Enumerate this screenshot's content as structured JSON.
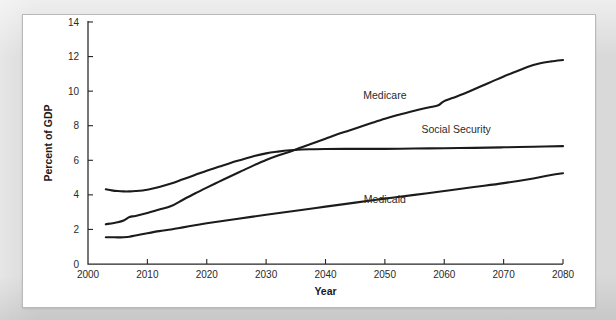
{
  "page": {
    "background_color": "#d7d7d7",
    "panel_color": "#ffffff",
    "panel_border_color": "#b9b9b9"
  },
  "chart_data": {
    "type": "line",
    "title": "",
    "xlabel": "Year",
    "ylabel": "Percent of GDP",
    "xlim": [
      2000,
      2080
    ],
    "ylim": [
      0,
      14
    ],
    "xticks": [
      2000,
      2010,
      2020,
      2030,
      2040,
      2050,
      2060,
      2070,
      2080
    ],
    "yticks": [
      0,
      2,
      4,
      6,
      8,
      10,
      12,
      14
    ],
    "xtick_labels": [
      "2000",
      "2010",
      "2020",
      "2030",
      "2040",
      "2050",
      "2060",
      "2070",
      "2080"
    ],
    "ytick_labels": [
      "0",
      "2",
      "4",
      "6",
      "8",
      "10",
      "12",
      "14"
    ],
    "grid": false,
    "legend": "inline-labels",
    "line_color": "#1b1b1b",
    "series": [
      {
        "name": "Medicare",
        "label": "Medicare",
        "label_x": 2050,
        "label_y": 9.55,
        "x": [
          2003,
          2005,
          2006,
          2007,
          2008,
          2010,
          2012,
          2014,
          2016,
          2018,
          2020,
          2022,
          2024,
          2026,
          2028,
          2030,
          2032,
          2034,
          2035,
          2036,
          2038,
          2040,
          2042,
          2044,
          2046,
          2048,
          2050,
          2052,
          2054,
          2056,
          2058,
          2059,
          2060,
          2062,
          2064,
          2066,
          2068,
          2070,
          2072,
          2074,
          2076,
          2078,
          2080
        ],
        "values": [
          2.3,
          2.42,
          2.52,
          2.72,
          2.78,
          2.95,
          3.15,
          3.35,
          3.72,
          4.08,
          4.42,
          4.75,
          5.08,
          5.4,
          5.72,
          6.02,
          6.28,
          6.5,
          6.62,
          6.75,
          7.0,
          7.25,
          7.5,
          7.72,
          7.95,
          8.18,
          8.4,
          8.6,
          8.78,
          8.95,
          9.1,
          9.18,
          9.42,
          9.68,
          9.95,
          10.25,
          10.55,
          10.85,
          11.12,
          11.4,
          11.6,
          11.72,
          11.8
        ]
      },
      {
        "name": "Social Security",
        "label": "Social Security",
        "label_x": 2062,
        "label_y": 7.55,
        "x": [
          2003,
          2004,
          2005,
          2006,
          2007,
          2008,
          2010,
          2012,
          2014,
          2016,
          2018,
          2020,
          2022,
          2024,
          2026,
          2028,
          2030,
          2032,
          2034,
          2035,
          2036,
          2038,
          2040,
          2045,
          2050,
          2055,
          2060,
          2065,
          2070,
          2075,
          2080
        ],
        "values": [
          4.32,
          4.26,
          4.22,
          4.2,
          4.2,
          4.22,
          4.3,
          4.45,
          4.65,
          4.9,
          5.15,
          5.4,
          5.62,
          5.85,
          6.05,
          6.25,
          6.4,
          6.5,
          6.58,
          6.6,
          6.62,
          6.64,
          6.65,
          6.66,
          6.66,
          6.68,
          6.7,
          6.72,
          6.75,
          6.78,
          6.82
        ]
      },
      {
        "name": "Medicaid",
        "label": "Medicaid",
        "label_x": 2050,
        "label_y": 3.55,
        "x": [
          2003,
          2004,
          2005,
          2006,
          2007,
          2008,
          2010,
          2012,
          2014,
          2016,
          2018,
          2020,
          2025,
          2030,
          2035,
          2040,
          2045,
          2050,
          2055,
          2060,
          2065,
          2070,
          2075,
          2078,
          2080
        ],
        "values": [
          1.55,
          1.55,
          1.54,
          1.55,
          1.58,
          1.65,
          1.78,
          1.9,
          2.0,
          2.12,
          2.24,
          2.36,
          2.6,
          2.85,
          3.08,
          3.32,
          3.55,
          3.78,
          4.0,
          4.22,
          4.45,
          4.68,
          4.95,
          5.15,
          5.25
        ]
      }
    ]
  }
}
